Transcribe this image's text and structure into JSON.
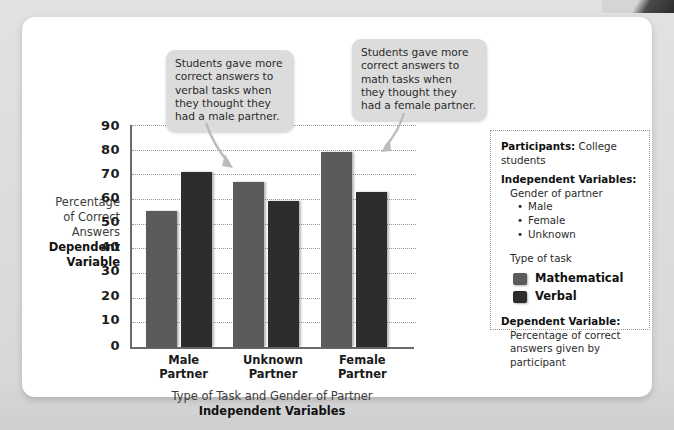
{
  "chart_data": {
    "type": "bar",
    "title": "",
    "categories": [
      "Male Partner",
      "Unknown Partner",
      "Female Partner"
    ],
    "series": [
      {
        "name": "Mathematical",
        "color": "#5b5b5b",
        "values": [
          55,
          67,
          79
        ]
      },
      {
        "name": "Verbal",
        "color": "#2d2d2d",
        "values": [
          71,
          59,
          63
        ]
      }
    ],
    "ylabel": "Percentage of Correct Answers",
    "ylabel_bold": "Dependent Variable",
    "xlabel": "Type of Task and Gender of Partner",
    "xlabel_bold": "Independent Variables",
    "ylim": [
      0,
      90
    ],
    "yticks": [
      "90",
      "80",
      "70",
      "60",
      "50",
      "40",
      "30",
      "20",
      "10",
      "0"
    ],
    "grid": true,
    "legend_position": "right"
  },
  "axis": {
    "y_title_line1": "Percentage",
    "y_title_line2": "of Correct",
    "y_title_line3": "Answers",
    "y_title_bold1": "Dependent",
    "y_title_bold2": "Variable",
    "x_title": "Type of Task and Gender of Partner",
    "x_title_bold": "Independent Variables",
    "x_categories": [
      {
        "line1": "Male Partner",
        "line2": ""
      },
      {
        "line1": "Unknown",
        "line2": "Partner"
      },
      {
        "line1": "Female",
        "line2": "Partner"
      }
    ]
  },
  "callouts": {
    "verbal": "Students gave more correct answers to verbal tasks when they thought they had a male partner.",
    "math": "Students gave more correct answers to math tasks when they thought they had a female partner."
  },
  "infobox": {
    "participants_label": "Participants:",
    "participants_value": "College students",
    "iv_label": "Independent Variables:",
    "iv_sub": "Gender of partner",
    "iv_bullets": [
      "Male",
      "Female",
      "Unknown"
    ],
    "task_label": "Type of task",
    "legend": [
      {
        "label": "Mathematical",
        "color": "#5b5b5b"
      },
      {
        "label": "Verbal",
        "color": "#2d2d2d"
      }
    ],
    "dv_label": "Dependent Variable:",
    "dv_line1": "Percentage of correct",
    "dv_line2": "answers given by participant"
  }
}
